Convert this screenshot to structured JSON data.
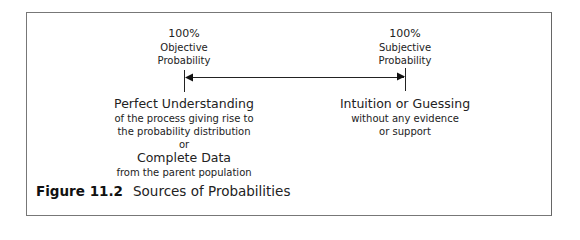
{
  "left_pole": {
    "percent": "100%",
    "line1": "Objective",
    "line2": "Probability",
    "heading": "Perfect Understanding",
    "desc1": "of the process giving rise to",
    "desc2": "the probability distribution",
    "connector": "or",
    "heading2": "Complete Data",
    "desc3": "from the parent population"
  },
  "right_pole": {
    "percent": "100%",
    "line1": "Subjective",
    "line2": "Probability",
    "heading": "Intuition or Guessing",
    "desc1": "without any evidence",
    "desc2": "or support"
  },
  "caption": {
    "number": "Figure 11.2",
    "title": "Sources of Probabilities"
  }
}
